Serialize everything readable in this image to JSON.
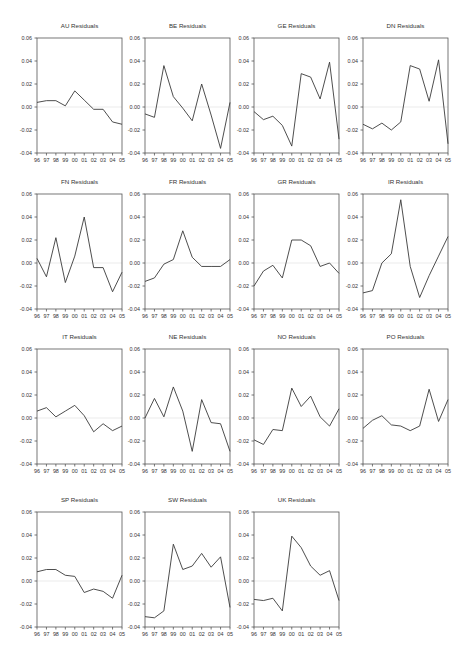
{
  "figure": {
    "layout": {
      "columns": 4,
      "rows": 4
    },
    "x_tick_labels": [
      "96",
      "97",
      "98",
      "99",
      "00",
      "01",
      "02",
      "03",
      "04",
      "05"
    ],
    "y_tick_labels": [
      "0.06",
      "0.04",
      "0.02",
      "0.00",
      "-0.02",
      "-0.04"
    ],
    "colors": {
      "line": "#3a3a3a",
      "frame": "#555555",
      "zero_line": "#e6e6e6",
      "text": "#333333"
    }
  },
  "chart_data": [
    {
      "type": "line",
      "title": "AU Residuals",
      "xlabel": "",
      "ylabel": "",
      "ylim": [
        -0.04,
        0.06
      ],
      "grid": false,
      "x": [
        "96",
        "97",
        "98",
        "99",
        "00",
        "01",
        "02",
        "03",
        "04",
        "05"
      ],
      "values": [
        0.004,
        0.0055,
        0.0055,
        0.001,
        0.014,
        0.006,
        -0.002,
        -0.002,
        -0.013,
        -0.015
      ]
    },
    {
      "type": "line",
      "title": "BE Residuals",
      "xlabel": "",
      "ylabel": "",
      "ylim": [
        -0.04,
        0.06
      ],
      "grid": false,
      "x": [
        "96",
        "97",
        "98",
        "99",
        "00",
        "01",
        "02",
        "03",
        "04",
        "05"
      ],
      "values": [
        -0.006,
        -0.009,
        0.036,
        0.009,
        -0.001,
        -0.012,
        0.02,
        -0.007,
        -0.036,
        0.004
      ]
    },
    {
      "type": "line",
      "title": "GE Residuals",
      "xlabel": "",
      "ylabel": "",
      "ylim": [
        -0.04,
        0.06
      ],
      "grid": false,
      "x": [
        "96",
        "97",
        "98",
        "99",
        "00",
        "01",
        "02",
        "03",
        "04",
        "05"
      ],
      "values": [
        -0.004,
        -0.011,
        -0.008,
        -0.016,
        -0.034,
        0.029,
        0.026,
        0.007,
        0.039,
        -0.028
      ]
    },
    {
      "type": "line",
      "title": "DN Residuals",
      "xlabel": "",
      "ylabel": "",
      "ylim": [
        -0.04,
        0.06
      ],
      "grid": false,
      "x": [
        "96",
        "97",
        "98",
        "99",
        "00",
        "01",
        "02",
        "03",
        "04",
        "05"
      ],
      "values": [
        -0.015,
        -0.019,
        -0.014,
        -0.02,
        -0.013,
        0.036,
        0.033,
        0.005,
        0.041,
        -0.032
      ]
    },
    {
      "type": "line",
      "title": "FN Residuals",
      "xlabel": "",
      "ylabel": "",
      "ylim": [
        -0.04,
        0.06
      ],
      "grid": false,
      "x": [
        "96",
        "97",
        "98",
        "99",
        "00",
        "01",
        "02",
        "03",
        "04",
        "05"
      ],
      "values": [
        0.004,
        -0.012,
        0.022,
        -0.017,
        0.006,
        0.04,
        -0.004,
        -0.004,
        -0.025,
        -0.008
      ]
    },
    {
      "type": "line",
      "title": "FR Residuals",
      "xlabel": "",
      "ylabel": "",
      "ylim": [
        -0.04,
        0.06
      ],
      "grid": false,
      "x": [
        "96",
        "97",
        "98",
        "99",
        "00",
        "01",
        "02",
        "03",
        "04",
        "05"
      ],
      "values": [
        -0.016,
        -0.013,
        -0.001,
        0.003,
        0.028,
        0.005,
        -0.003,
        -0.003,
        -0.003,
        0.003
      ]
    },
    {
      "type": "line",
      "title": "GR Residuals",
      "xlabel": "",
      "ylabel": "",
      "ylim": [
        -0.04,
        0.06
      ],
      "grid": false,
      "x": [
        "96",
        "97",
        "98",
        "99",
        "00",
        "01",
        "02",
        "03",
        "04",
        "05"
      ],
      "values": [
        -0.02,
        -0.007,
        -0.002,
        -0.013,
        0.02,
        0.02,
        0.015,
        -0.003,
        0.0,
        -0.009
      ]
    },
    {
      "type": "line",
      "title": "IR Residuals",
      "xlabel": "",
      "ylabel": "",
      "ylim": [
        -0.04,
        0.06
      ],
      "grid": false,
      "x": [
        "96",
        "97",
        "98",
        "99",
        "00",
        "01",
        "02",
        "03",
        "04",
        "05"
      ],
      "values": [
        -0.026,
        -0.024,
        0.0,
        0.008,
        0.055,
        -0.003,
        -0.03,
        -0.011,
        0.006,
        0.023
      ]
    },
    {
      "type": "line",
      "title": "IT Residuals",
      "xlabel": "",
      "ylabel": "",
      "ylim": [
        -0.04,
        0.06
      ],
      "grid": false,
      "x": [
        "96",
        "97",
        "98",
        "99",
        "00",
        "01",
        "02",
        "03",
        "04",
        "05"
      ],
      "values": [
        0.006,
        0.009,
        0.001,
        0.006,
        0.011,
        0.002,
        -0.012,
        -0.005,
        -0.011,
        -0.007
      ]
    },
    {
      "type": "line",
      "title": "NE Residuals",
      "xlabel": "",
      "ylabel": "",
      "ylim": [
        -0.04,
        0.06
      ],
      "grid": false,
      "x": [
        "96",
        "97",
        "98",
        "99",
        "00",
        "01",
        "02",
        "03",
        "04",
        "05"
      ],
      "values": [
        0.0,
        0.017,
        0.001,
        0.027,
        0.006,
        -0.029,
        0.016,
        -0.004,
        -0.005,
        -0.029
      ]
    },
    {
      "type": "line",
      "title": "NO Residuals",
      "xlabel": "",
      "ylabel": "",
      "ylim": [
        -0.04,
        0.06
      ],
      "grid": false,
      "x": [
        "96",
        "97",
        "98",
        "99",
        "00",
        "01",
        "02",
        "03",
        "04",
        "05"
      ],
      "values": [
        -0.019,
        -0.023,
        -0.01,
        -0.011,
        0.026,
        0.01,
        0.019,
        0.001,
        -0.007,
        0.008
      ]
    },
    {
      "type": "line",
      "title": "PO Residuals",
      "xlabel": "",
      "ylabel": "",
      "ylim": [
        -0.04,
        0.06
      ],
      "grid": false,
      "x": [
        "96",
        "97",
        "98",
        "99",
        "00",
        "01",
        "02",
        "03",
        "04",
        "05"
      ],
      "values": [
        -0.009,
        -0.002,
        0.002,
        -0.006,
        -0.007,
        -0.011,
        -0.007,
        0.025,
        -0.003,
        0.016
      ]
    },
    {
      "type": "line",
      "title": "SP Residuals",
      "xlabel": "",
      "ylabel": "",
      "ylim": [
        -0.04,
        0.06
      ],
      "grid": false,
      "x": [
        "96",
        "97",
        "98",
        "99",
        "00",
        "01",
        "02",
        "03",
        "04",
        "05"
      ],
      "values": [
        0.008,
        0.01,
        0.01,
        0.005,
        0.004,
        -0.01,
        -0.007,
        -0.009,
        -0.015,
        0.005
      ]
    },
    {
      "type": "line",
      "title": "SW Residuals",
      "xlabel": "",
      "ylabel": "",
      "ylim": [
        -0.04,
        0.06
      ],
      "grid": false,
      "x": [
        "96",
        "97",
        "98",
        "99",
        "00",
        "01",
        "02",
        "03",
        "04",
        "05"
      ],
      "values": [
        -0.031,
        -0.032,
        -0.026,
        0.032,
        0.01,
        0.013,
        0.024,
        0.012,
        0.021,
        -0.023
      ]
    },
    {
      "type": "line",
      "title": "UK Residuals",
      "xlabel": "",
      "ylabel": "",
      "ylim": [
        -0.04,
        0.06
      ],
      "grid": false,
      "x": [
        "96",
        "97",
        "98",
        "99",
        "00",
        "01",
        "02",
        "03",
        "04",
        "05"
      ],
      "values": [
        -0.016,
        -0.017,
        -0.015,
        -0.026,
        0.039,
        0.029,
        0.013,
        0.005,
        0.009,
        -0.017
      ]
    }
  ]
}
